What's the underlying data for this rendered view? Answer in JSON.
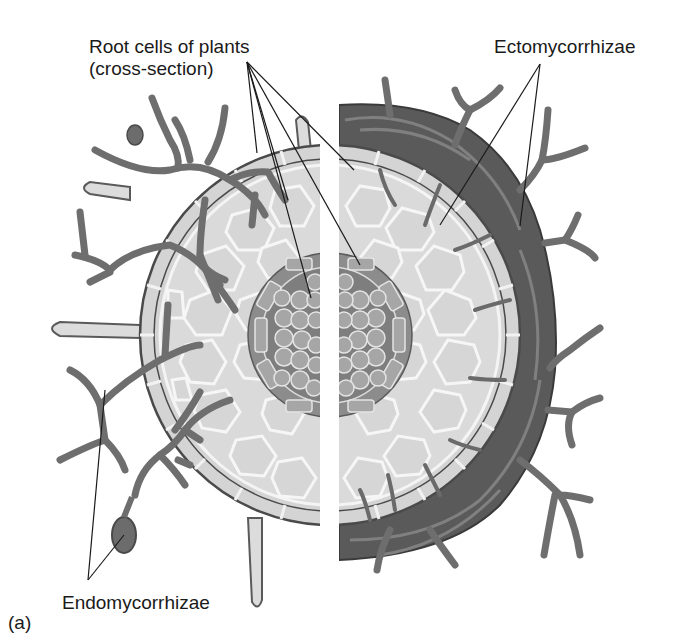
{
  "figure": {
    "panel_label": "(a)",
    "labels": {
      "root_cells_line1": "Root cells of plants",
      "root_cells_line2": "(cross-section)",
      "ectomycorrhizae": "Ectomycorrhizae",
      "endomycorrhizae": "Endomycorrhizae"
    },
    "colors": {
      "background": "#ffffff",
      "cortex_fill": "#d9d9d9",
      "cell_wall": "#f4f4f4",
      "cell_outline": "#5a5a5a",
      "stele_fill": "#8a8a8a",
      "stele_cell": "#a8a8a8",
      "hyphae": "#707070",
      "hyphae_outline": "#4a4a4a",
      "mantle": "#5c5c5c",
      "leader_line": "#1a1a1a"
    },
    "regions": {
      "left_half": "Endomycorrhizae — hyphae penetrate root cells",
      "right_half": "Ectomycorrhizae — hyphal mantle sheathes the root"
    }
  }
}
